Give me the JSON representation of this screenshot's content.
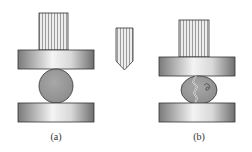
{
  "figure": {
    "panels": [
      {
        "id": "a",
        "label": "(a)",
        "state": "intact specimen between plates"
      },
      {
        "id": "b",
        "label": "(b)",
        "state": "cracked specimen between plates"
      }
    ],
    "middle_tool": "wedge-indenter",
    "colors": {
      "outline": "#333333",
      "specimen_fill": "#9a9a9a",
      "plate_dark": "#7a7a7a",
      "plate_light": "#f4f4f4",
      "ram_fill": "#e6e6e6",
      "ram_stripe": "#8a8a8a"
    }
  }
}
